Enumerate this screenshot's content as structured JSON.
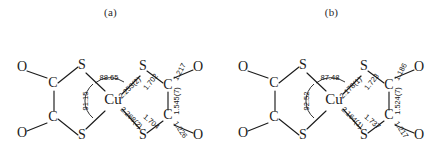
{
  "figure": {
    "background_color": "#ffffff",
    "ink_color": "#1b1b1b",
    "panels": [
      {
        "id": "a",
        "caption": "(a)",
        "metal_label": "Cu",
        "atoms": {
          "o_top_left": "O",
          "o_bottom_left": "O",
          "c_top_left": "C",
          "c_bottom_left": "C",
          "s_top_left": "S",
          "s_bottom_left": "S",
          "s_top_right": "S",
          "s_bottom_right": "S",
          "c_top_right": "C",
          "c_bottom_right": "C",
          "o_top_right": "O",
          "o_bottom_right": "O"
        },
        "angles": {
          "top": "88.65",
          "left": "91.15"
        },
        "distances": {
          "cu_s_top": "2.253(2)",
          "cu_s_bottom": "2.268(2)",
          "s_c_top": "1.702",
          "s_c_bottom": "1.704",
          "c_o_top": "1.217",
          "c_o_bottom": "1.226",
          "c_c_right": "1.545(7)"
        }
      },
      {
        "id": "b",
        "caption": "(b)",
        "metal_label": "Cu",
        "atoms": {
          "o_top_left": "O",
          "o_bottom_left": "O",
          "c_top_left": "C",
          "c_bottom_left": "C",
          "s_top_left": "S",
          "s_bottom_left": "S",
          "s_top_right": "S",
          "s_bottom_right": "S",
          "c_top_right": "C",
          "c_bottom_right": "C",
          "o_top_right": "O",
          "o_bottom_right": "O"
        },
        "angles": {
          "top": "87.48",
          "left": "92.52"
        },
        "distances": {
          "cu_s_top": "2.178(1)",
          "cu_s_bottom": "2.164(1)",
          "s_c_top": "1.723",
          "s_c_bottom": "1.737",
          "c_o_top": "1.186",
          "c_o_bottom": "1.217",
          "c_c_right": "1.524(7)"
        }
      }
    ]
  }
}
